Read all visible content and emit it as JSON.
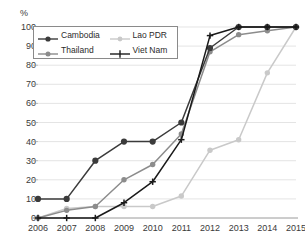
{
  "chart_data": {
    "type": "line",
    "title": "",
    "xlabel": "",
    "ylabel": "%",
    "y_unit_label": "%",
    "categories": [
      "2006",
      "2007",
      "2008",
      "2009",
      "2010",
      "2011",
      "2012",
      "2013",
      "2014",
      "2015"
    ],
    "x": [
      2006,
      2007,
      2008,
      2009,
      2010,
      2011,
      2012,
      2013,
      2014,
      2015
    ],
    "xlim": [
      2006,
      2015
    ],
    "ylim": [
      0,
      100
    ],
    "yticks": [
      0,
      10,
      20,
      30,
      40,
      50,
      60,
      70,
      80,
      90,
      100
    ],
    "ytick_labels": [
      "0",
      "10",
      "20",
      "30",
      "40",
      "50",
      "60",
      "70",
      "80",
      "90",
      "100"
    ],
    "xtick_labels": [
      "2006",
      "2007",
      "2008",
      "2009",
      "2010",
      "2011",
      "2012",
      "2013",
      "2014",
      "2015"
    ],
    "grid": true,
    "grid_axis": "y",
    "grid_color": "#d9d9d9",
    "legend_position": "upper-left",
    "series": [
      {
        "name": "Cambodia",
        "color": "#3b3b3b",
        "marker": "circle",
        "values": [
          10,
          10,
          30,
          40,
          40,
          50,
          89,
          100,
          100,
          100
        ]
      },
      {
        "name": "Lao PDR",
        "color": "#c9c9c9",
        "marker": "circle",
        "values": [
          0,
          5,
          6,
          6,
          6,
          11.5,
          35.5,
          41,
          76,
          100
        ]
      },
      {
        "name": "Thailand",
        "color": "#8c8c8c",
        "marker": "circle",
        "values": [
          0,
          4,
          6,
          20,
          28,
          44,
          87,
          96,
          98,
          100
        ]
      },
      {
        "name": "Viet Nam",
        "color": "#1a1a1a",
        "marker": "plus",
        "values": [
          0,
          0,
          0,
          8,
          19,
          41,
          95.5,
          100,
          100,
          100
        ]
      }
    ]
  },
  "legend": {
    "entries": [
      {
        "label": "Cambodia"
      },
      {
        "label": "Lao PDR"
      },
      {
        "label": "Thailand"
      },
      {
        "label": "Viet Nam"
      }
    ]
  }
}
